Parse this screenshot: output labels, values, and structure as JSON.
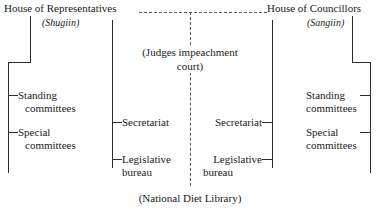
{
  "diagram": {
    "title_left": "House of Representatives",
    "subtitle_left": "(Shugiin)",
    "title_right": "House of Councillors",
    "subtitle_right": "(Sangiin)",
    "center_node_line1": "(Judges impeachment",
    "center_node_line2": "court)",
    "bottom_node": "(National Diet Library)",
    "left_branch": {
      "item1_line1": "Standing",
      "item1_line2": "committees",
      "item2_line1": "Special",
      "item2_line2": "committees"
    },
    "left_inner_branch": {
      "item1": "Secretariat",
      "item2_line1": "Legislative",
      "item2_line2": "bureau"
    },
    "right_inner_branch": {
      "item1": "Secretariat",
      "item2_line1": "Legislative",
      "item2_line2": "bureau"
    },
    "right_branch": {
      "item1_line1": "Standing",
      "item1_line2": "committees",
      "item2_line1": "Special",
      "item2_line2": "committees"
    },
    "colors": {
      "stroke": "#2b2b2b",
      "dashed_stroke": "#555555",
      "text": "#1a1a1a",
      "background": "#ffffff"
    }
  }
}
